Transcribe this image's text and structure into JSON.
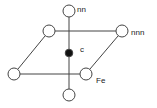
{
  "diagram": {
    "title": "",
    "colors": {
      "stroke": "#444444",
      "fill_open": "#ffffff",
      "fill_solid": "#111111"
    },
    "labels": {
      "nn": "nn",
      "nnn": "nnn",
      "c": "c",
      "fe": "Fe"
    },
    "nodes": [
      {
        "id": "top",
        "type": "open",
        "x": 69,
        "y": 11,
        "label_key": "nn"
      },
      {
        "id": "top-left",
        "type": "open",
        "x": 49,
        "y": 31
      },
      {
        "id": "top-right",
        "type": "open",
        "x": 122,
        "y": 31,
        "label_key": "nnn"
      },
      {
        "id": "center",
        "type": "solid",
        "x": 69,
        "y": 53,
        "label_key": "c"
      },
      {
        "id": "bottom-left",
        "type": "open",
        "x": 14,
        "y": 74
      },
      {
        "id": "bottom-right",
        "type": "open",
        "x": 86,
        "y": 74,
        "label_key": "fe"
      },
      {
        "id": "bottom",
        "type": "open",
        "x": 69,
        "y": 95
      }
    ]
  }
}
